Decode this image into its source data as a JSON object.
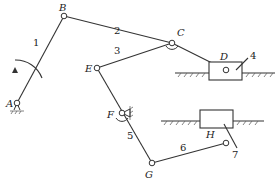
{
  "diagram": {
    "type": "planar linkage mechanism",
    "joints": {
      "A": {
        "label": "A",
        "x": 17,
        "y": 103
      },
      "B": {
        "label": "B",
        "x": 64,
        "y": 16
      },
      "C": {
        "label": "C",
        "x": 172,
        "y": 43
      },
      "D": {
        "label": "D",
        "x": 226,
        "y": 70
      },
      "E": {
        "label": "E",
        "x": 97,
        "y": 68
      },
      "F": {
        "label": "F",
        "x": 122,
        "y": 113
      },
      "G": {
        "label": "G",
        "x": 152,
        "y": 163
      },
      "H": {
        "label": "H",
        "x": 226,
        "y": 143
      }
    },
    "links": [
      {
        "id": "1",
        "label": "1",
        "from": "A",
        "to": "B"
      },
      {
        "id": "2",
        "label": "2",
        "from": "B",
        "to": "C"
      },
      {
        "id": "3",
        "label": "3",
        "from": "C",
        "to": "E"
      },
      {
        "id": "4",
        "label": "4",
        "element": "slider D"
      },
      {
        "id": "5",
        "label": "5",
        "from": "E",
        "to": "G"
      },
      {
        "id": "6",
        "label": "6",
        "from": "G",
        "to": "H"
      },
      {
        "id": "7",
        "label": "7",
        "element": "slider H"
      }
    ]
  }
}
